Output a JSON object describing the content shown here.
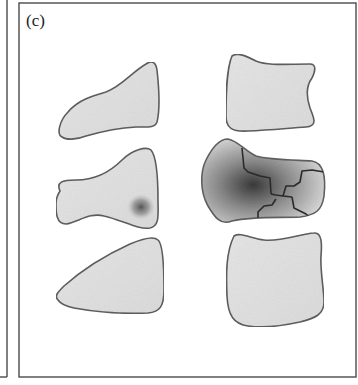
{
  "figure": {
    "panel_label": "(c)",
    "colors": {
      "background": "#ffffff",
      "bone_fill": "#e2e2e2",
      "bone_outline": "#5e5e5e",
      "lesion": "#5a5a5a",
      "fracture_shading": "#3f3f3f",
      "crack_line": "#2a2a2a",
      "frame": "#4a4a4a"
    },
    "left_column": [
      {
        "name": "upper-vertebra-left",
        "feature": "none"
      },
      {
        "name": "middle-vertebra-left",
        "feature": "focal-dark-lesion"
      },
      {
        "name": "lower-vertebra-left",
        "feature": "none"
      }
    ],
    "right_column": [
      {
        "name": "upper-vertebra-right",
        "feature": "none"
      },
      {
        "name": "middle-vertebra-right",
        "feature": "fracture-with-cracks"
      },
      {
        "name": "lower-vertebra-right",
        "feature": "none"
      }
    ]
  }
}
